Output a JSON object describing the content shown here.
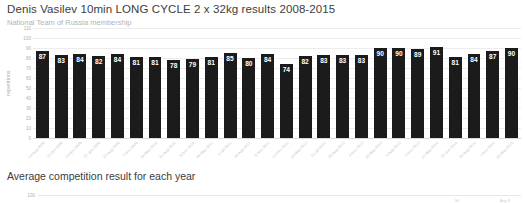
{
  "chart1": {
    "title": "Denis Vasilev 10min LONG CYCLE 2 x 32kg results 2008-2015",
    "subtitle": "National Team of Russia membership",
    "ylabel": "repetitions"
  },
  "chart2": {
    "title": "Average competition result for each year",
    "tick_100": "100",
    "partial_label_left": "90",
    "partial_label_right": "Avg. 8"
  },
  "chart_data": [
    {
      "type": "bar",
      "title": "Denis Vasilev 10min LONG CYCLE 2 x 32kg results 2008-2015",
      "subtitle": "National Team of Russia membership",
      "xlabel": "",
      "ylabel": "repetitions",
      "ylim": [
        0,
        110
      ],
      "yticks": [
        0,
        10,
        20,
        30,
        40,
        50,
        60,
        70,
        80,
        90,
        100,
        110
      ],
      "grid": true,
      "legend": "none",
      "bar_color": "#1b1b1b",
      "categories": [
        "14-Aug-2008",
        "11-Oct-2008",
        "14-Nov-2008",
        "27-Jun-2009",
        "22-Aug-2009",
        "7-Nov-2009",
        "29-May-2010",
        "21-Aug-2010",
        "6-Nov-2010",
        "28-May-2011",
        "3-Jul-2011",
        "20-Aug-2011",
        "5-Nov-2011",
        "12-Dec-2011",
        "19-May-2012",
        "21-Jul-2012",
        "25-Aug-2012",
        "3-Nov-2012",
        "25-May-2013",
        "3-Aug-2013",
        "2-Nov-2013",
        "17-May-2014",
        "22-Jun-2014",
        "23-Aug-2014",
        "1-Nov-2014",
        "24-May-2015"
      ],
      "values": [
        87,
        83,
        84,
        82,
        84,
        81,
        81,
        78,
        79,
        81,
        85,
        80,
        84,
        74,
        82,
        83,
        83,
        83,
        90,
        90,
        89,
        91,
        81,
        84,
        87,
        90
      ]
    },
    {
      "type": "bar",
      "title": "Average competition result for each year",
      "ylabel": "",
      "yticks": [
        100
      ],
      "grid": true,
      "note": "chart cropped at bottom of viewport"
    }
  ]
}
